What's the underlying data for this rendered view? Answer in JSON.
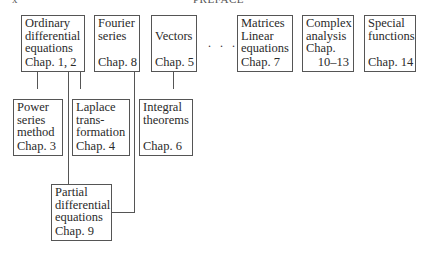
{
  "page_header": {
    "left": "x",
    "center": "PREFACE"
  },
  "ellipsis": ". . .",
  "boxes": {
    "ode": {
      "lines": [
        "Ordinary",
        "differential",
        "equations"
      ],
      "chapter": "Chap. 1, 2"
    },
    "fourier": {
      "lines": [
        "Fourier",
        "series"
      ],
      "chapter": "Chap. 8"
    },
    "vectors": {
      "lines": [
        "Vectors"
      ],
      "chapter": "Chap. 5"
    },
    "matrices": {
      "lines": [
        "Matrices",
        "Linear",
        "equations"
      ],
      "chapter": "Chap. 7"
    },
    "complex": {
      "lines": [
        "Complex",
        "analysis",
        "Chap."
      ],
      "chapter": "10–13"
    },
    "special": {
      "lines": [
        "Special",
        "functions"
      ],
      "chapter": "Chap. 14"
    },
    "power": {
      "lines": [
        "Power",
        "series",
        "method"
      ],
      "chapter": "Chap. 3"
    },
    "laplace": {
      "lines": [
        "Laplace",
        "trans-",
        "formation"
      ],
      "chapter": "Chap. 4"
    },
    "integral": {
      "lines": [
        "Integral",
        "theorems"
      ],
      "chapter": "Chap. 6"
    },
    "pde": {
      "lines": [
        "Partial",
        "differential",
        "equations"
      ],
      "chapter": "Chap. 9"
    }
  }
}
